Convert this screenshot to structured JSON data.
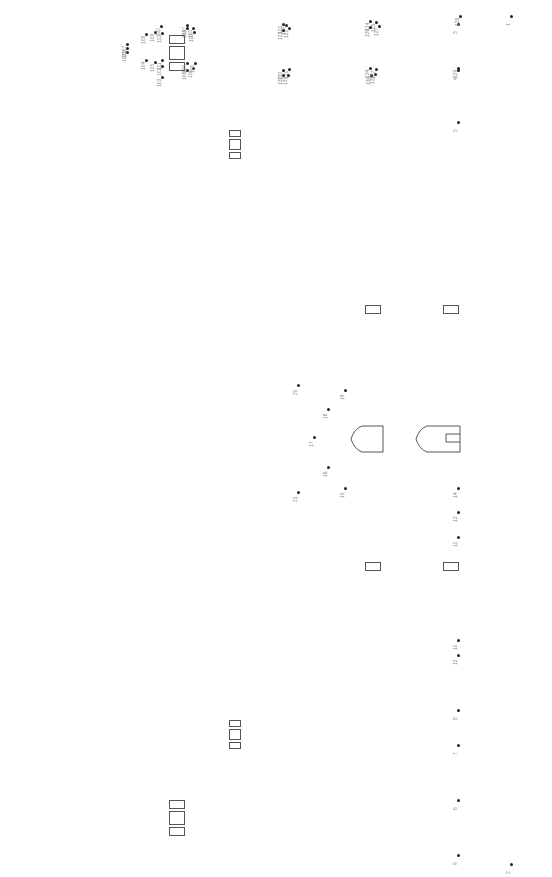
{
  "diagram": {
    "type": "numbered point layout (rotated labels)",
    "background": "#ffffff",
    "dot_color": "#222222",
    "label_color": "#8a8a8a",
    "outline_color": "#555555",
    "rect_groups": [
      {
        "name": "triple-rect-top-left",
        "x": 169,
        "y": 35,
        "rects": [
          [
            0,
            0,
            16,
            9
          ],
          [
            0,
            11,
            16,
            14
          ],
          [
            0,
            27,
            16,
            9
          ]
        ]
      },
      {
        "name": "triple-rect-upper-mid",
        "x": 229,
        "y": 130,
        "rects": [
          [
            0,
            0,
            12,
            7
          ],
          [
            0,
            9,
            12,
            11
          ],
          [
            0,
            22,
            12,
            7
          ]
        ]
      },
      {
        "name": "triple-rect-lower-mid",
        "x": 229,
        "y": 720,
        "rects": [
          [
            0,
            0,
            12,
            7
          ],
          [
            0,
            9,
            12,
            11
          ],
          [
            0,
            22,
            12,
            7
          ]
        ]
      },
      {
        "name": "triple-rect-bottom-left",
        "x": 169,
        "y": 800,
        "rects": [
          [
            0,
            0,
            16,
            9
          ],
          [
            0,
            11,
            16,
            14
          ],
          [
            0,
            27,
            16,
            9
          ]
        ]
      }
    ],
    "single_rects": [
      {
        "name": "rect-a",
        "x": 365,
        "y": 305,
        "w": 16,
        "h": 9
      },
      {
        "name": "rect-b",
        "x": 443,
        "y": 305,
        "w": 16,
        "h": 9
      },
      {
        "name": "rect-c",
        "x": 365,
        "y": 562,
        "w": 16,
        "h": 9
      },
      {
        "name": "rect-d",
        "x": 443,
        "y": 562,
        "w": 16,
        "h": 9
      }
    ],
    "shields": [
      {
        "name": "shield-left",
        "x": 350,
        "y": 425,
        "w": 33,
        "h": 26,
        "notch": false
      },
      {
        "name": "shield-right",
        "x": 415,
        "y": 425,
        "w": 45,
        "h": 26,
        "notch": true
      }
    ],
    "points": [
      {
        "id": "1",
        "x": 511,
        "y": 16
      },
      {
        "id": "2",
        "x": 511,
        "y": 864
      },
      {
        "id": "3",
        "x": 458,
        "y": 24
      },
      {
        "id": "4",
        "x": 458,
        "y": 70
      },
      {
        "id": "5",
        "x": 458,
        "y": 122
      },
      {
        "id": "6",
        "x": 458,
        "y": 800
      },
      {
        "id": "7",
        "x": 458,
        "y": 745
      },
      {
        "id": "8",
        "x": 458,
        "y": 710
      },
      {
        "id": "9",
        "x": 458,
        "y": 855
      },
      {
        "id": "10",
        "x": 458,
        "y": 640
      },
      {
        "id": "11",
        "x": 458,
        "y": 537
      },
      {
        "id": "12",
        "x": 458,
        "y": 655
      },
      {
        "id": "13",
        "x": 458,
        "y": 512
      },
      {
        "id": "14",
        "x": 458,
        "y": 488
      },
      {
        "id": "15",
        "x": 345,
        "y": 488
      },
      {
        "id": "16",
        "x": 328,
        "y": 467
      },
      {
        "id": "17",
        "x": 314,
        "y": 437
      },
      {
        "id": "18",
        "x": 328,
        "y": 409
      },
      {
        "id": "19",
        "x": 345,
        "y": 390
      },
      {
        "id": "20",
        "x": 298,
        "y": 385
      },
      {
        "id": "21",
        "x": 298,
        "y": 492
      },
      {
        "id": "100",
        "x": 127,
        "y": 48
      },
      {
        "id": "101",
        "x": 127,
        "y": 52
      },
      {
        "id": "102",
        "x": 162,
        "y": 66
      },
      {
        "id": "103",
        "x": 162,
        "y": 77
      },
      {
        "id": "104",
        "x": 146,
        "y": 60
      },
      {
        "id": "105",
        "x": 155,
        "y": 62
      },
      {
        "id": "106",
        "x": 187,
        "y": 70
      },
      {
        "id": "107",
        "x": 127,
        "y": 44
      },
      {
        "id": "108",
        "x": 146,
        "y": 34
      },
      {
        "id": "109",
        "x": 155,
        "y": 32
      },
      {
        "id": "110",
        "x": 161,
        "y": 26
      },
      {
        "id": "111",
        "x": 162,
        "y": 60
      },
      {
        "id": "112",
        "x": 162,
        "y": 33
      },
      {
        "id": "113",
        "x": 194,
        "y": 32
      },
      {
        "id": "114",
        "x": 187,
        "y": 28
      },
      {
        "id": "115",
        "x": 193,
        "y": 28
      },
      {
        "id": "116",
        "x": 193,
        "y": 68
      },
      {
        "id": "117",
        "x": 187,
        "y": 25
      },
      {
        "id": "118",
        "x": 195,
        "y": 63
      },
      {
        "id": "119",
        "x": 187,
        "y": 63
      },
      {
        "id": "120",
        "x": 286,
        "y": 25
      },
      {
        "id": "121",
        "x": 283,
        "y": 24
      },
      {
        "id": "122",
        "x": 289,
        "y": 28
      },
      {
        "id": "123",
        "x": 283,
        "y": 30
      },
      {
        "id": "124",
        "x": 370,
        "y": 21
      },
      {
        "id": "125",
        "x": 376,
        "y": 22
      },
      {
        "id": "126",
        "x": 370,
        "y": 27
      },
      {
        "id": "127",
        "x": 379,
        "y": 26
      },
      {
        "id": "128",
        "x": 460,
        "y": 16
      },
      {
        "id": "129",
        "x": 458,
        "y": 68
      },
      {
        "id": "130",
        "x": 283,
        "y": 70
      },
      {
        "id": "131",
        "x": 289,
        "y": 69
      },
      {
        "id": "132",
        "x": 283,
        "y": 75
      },
      {
        "id": "133",
        "x": 288,
        "y": 75
      },
      {
        "id": "134",
        "x": 370,
        "y": 68
      },
      {
        "id": "135",
        "x": 375,
        "y": 74
      },
      {
        "id": "136",
        "x": 371,
        "y": 75
      },
      {
        "id": "137",
        "x": 376,
        "y": 69
      }
    ],
    "scatter_labels_legible": [
      "1",
      "2",
      "3",
      "4",
      "5",
      "6",
      "7",
      "8",
      "9",
      "10",
      "11",
      "12",
      "13",
      "14",
      "15",
      "16",
      "17",
      "18",
      "19",
      "20",
      "21",
      "100",
      "101",
      "102",
      "103",
      "104",
      "105",
      "106",
      "107",
      "108",
      "109",
      "110",
      "111",
      "112",
      "113",
      "114",
      "115",
      "116",
      "117",
      "118",
      "119",
      "120",
      "121",
      "122",
      "123",
      "124",
      "125",
      "126",
      "127",
      "128",
      "129",
      "130",
      "131",
      "132",
      "133",
      "134",
      "135",
      "136",
      "137",
      "138",
      "139",
      "140",
      "141",
      "142",
      "143",
      "144",
      "145",
      "146",
      "147",
      "148",
      "149",
      "150",
      "151",
      "152",
      "153",
      "154",
      "155",
      "156",
      "157",
      "158",
      "159",
      "160",
      "161",
      "162",
      "163",
      "164",
      "165",
      "166",
      "167",
      "168",
      "169",
      "170",
      "171",
      "172",
      "173",
      "174",
      "175",
      "176",
      "177",
      "178",
      "179",
      "180",
      "181",
      "182",
      "183",
      "184",
      "185",
      "186",
      "187",
      "188",
      "189",
      "190",
      "191",
      "192",
      "193",
      "194",
      "195",
      "196",
      "197",
      "198",
      "199",
      "200",
      "201",
      "202",
      "203",
      "204",
      "205",
      "206",
      "207",
      "208",
      "209",
      "210",
      "211",
      "212",
      "213",
      "214",
      "215",
      "216",
      "217",
      "218",
      "219",
      "220",
      "221",
      "222",
      "223",
      "224",
      "225",
      "226",
      "227",
      "228",
      "229",
      "230",
      "231",
      "232",
      "233",
      "234",
      "235",
      "236",
      "237",
      "238",
      "239",
      "240",
      "241",
      "242",
      "243",
      "244",
      "245",
      "246",
      "247",
      "248",
      "249",
      "250",
      "251",
      "252",
      "253",
      "254",
      "255",
      "256",
      "257",
      "258",
      "259",
      "260",
      "261",
      "262",
      "263",
      "264",
      "265",
      "266",
      "267",
      "268",
      "269",
      "270",
      "271",
      "272",
      "273",
      "274",
      "275",
      "276",
      "277",
      "278",
      "279",
      "280",
      "281",
      "282",
      "283",
      "284",
      "285",
      "286",
      "287",
      "288",
      "289",
      "290",
      "291",
      "292",
      "293",
      "294",
      "295",
      "296",
      "297",
      "298",
      "299",
      "300",
      "301",
      "302",
      "303",
      "304",
      "305",
      "306",
      "307",
      "308",
      "309",
      "310",
      "311",
      "312",
      "313",
      "314",
      "315",
      "316",
      "317",
      "318",
      "319",
      "320",
      "321",
      "322",
      "323",
      "324",
      "325",
      "326",
      "327",
      "328",
      "329",
      "330",
      "331",
      "332",
      "333",
      "334",
      "335",
      "336",
      "337",
      "338",
      "339",
      "340",
      "341",
      "342",
      "343",
      "344",
      "345",
      "346",
      "347",
      "348",
      "349",
      "350",
      "351",
      "352",
      "353",
      "354",
      "355",
      "356",
      "357",
      "358",
      "359",
      "360",
      "361",
      "362",
      "363",
      "364",
      "365",
      "366",
      "367",
      "368",
      "369",
      "370",
      "371",
      "372",
      "373",
      "374",
      "375",
      "376",
      "377",
      "378",
      "379",
      "380"
    ]
  }
}
